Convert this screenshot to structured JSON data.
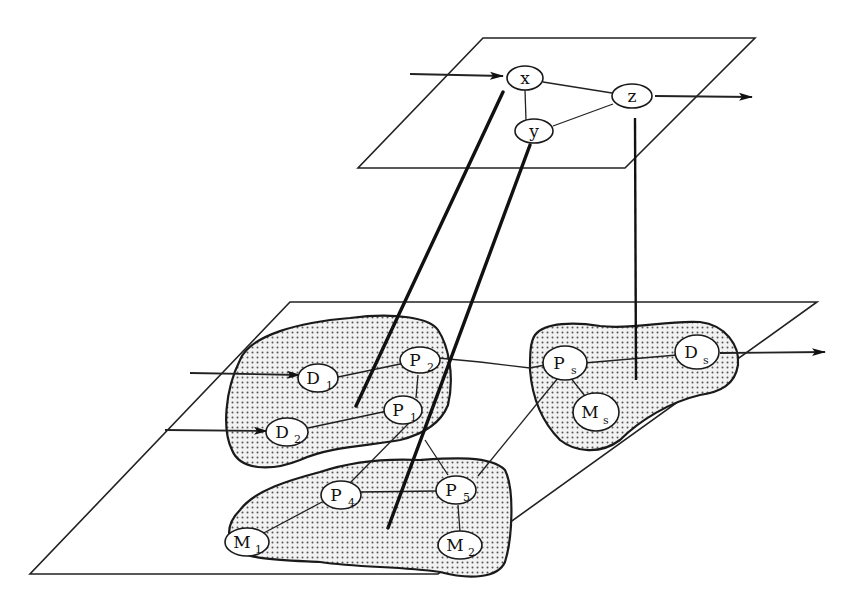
{
  "diagram": {
    "upper_plane": {
      "nodes": [
        {
          "id": "x",
          "label": "x",
          "sub": ""
        },
        {
          "id": "y",
          "label": "y",
          "sub": ""
        },
        {
          "id": "z",
          "label": "z",
          "sub": ""
        }
      ],
      "edges": [
        [
          "x",
          "z"
        ],
        [
          "x",
          "y"
        ],
        [
          "y",
          "z"
        ]
      ],
      "input_arrow_to": "x",
      "output_arrow_from": "z"
    },
    "lower_plane": {
      "regions": [
        "cluster-1",
        "cluster-2",
        "cluster-s"
      ],
      "nodes": [
        {
          "id": "D1",
          "label": "D",
          "sub": "1"
        },
        {
          "id": "D2",
          "label": "D",
          "sub": "2"
        },
        {
          "id": "P1",
          "label": "P",
          "sub": "1"
        },
        {
          "id": "P2",
          "label": "P",
          "sub": "2"
        },
        {
          "id": "P4",
          "label": "P",
          "sub": "4"
        },
        {
          "id": "P5",
          "label": "P",
          "sub": "5"
        },
        {
          "id": "M1",
          "label": "M",
          "sub": "1"
        },
        {
          "id": "M2",
          "label": "M",
          "sub": "2"
        },
        {
          "id": "Ps",
          "label": "P",
          "sub": "s"
        },
        {
          "id": "Ds",
          "label": "D",
          "sub": "s"
        },
        {
          "id": "Ms",
          "label": "M",
          "sub": "s"
        }
      ],
      "edges": [
        [
          "D1",
          "P2"
        ],
        [
          "D2",
          "P1"
        ],
        [
          "P1",
          "P2"
        ],
        [
          "P2",
          "Ps"
        ],
        [
          "Ps",
          "Ds"
        ],
        [
          "Ps",
          "Ms"
        ],
        [
          "Ps",
          "P5"
        ],
        [
          "P1",
          "P4"
        ],
        [
          "P1",
          "P5"
        ],
        [
          "P4",
          "P5"
        ],
        [
          "P4",
          "M1"
        ],
        [
          "P5",
          "M2"
        ]
      ],
      "input_arrows_to": [
        "D1",
        "D2"
      ],
      "output_arrow_from": "Ds"
    },
    "mappings": [
      {
        "from": "x",
        "to": "cluster-1"
      },
      {
        "from": "y",
        "to": "cluster-2"
      },
      {
        "from": "z",
        "to": "cluster-s"
      }
    ]
  }
}
